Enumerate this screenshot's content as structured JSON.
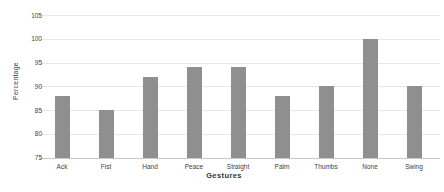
{
  "chart_data": {
    "type": "bar",
    "title": "",
    "categories": [
      "Ack",
      "Fist",
      "Hand",
      "Peace",
      "Straight",
      "Palm",
      "Thumbs",
      "None",
      "Swing"
    ],
    "values": [
      88,
      85,
      92,
      94,
      94,
      88,
      90,
      100,
      90
    ],
    "series_name": "Percentage",
    "xlabel": "Gestures",
    "ylabel": "Percentage",
    "ylim": [
      75,
      105
    ],
    "ytick_step": 5,
    "yticks": [
      75,
      80,
      85,
      90,
      95,
      100,
      105
    ],
    "grid": true,
    "legend": "none"
  },
  "colors": {
    "bar": "#8f8f8f",
    "gridline": "#e7e7e7",
    "axis_line": "#c9c9c9",
    "text": "#404040",
    "background": "#ffffff"
  }
}
